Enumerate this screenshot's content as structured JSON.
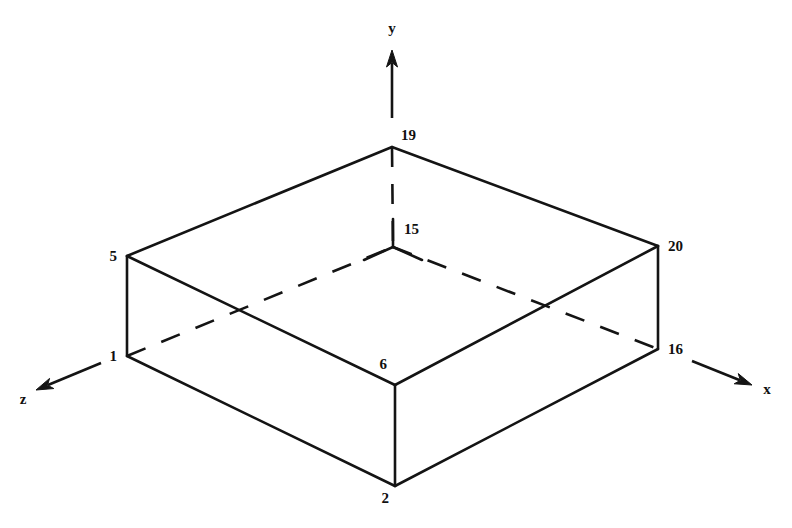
{
  "figure": {
    "background_color": "#ffffff",
    "line_color": "#141414"
  },
  "axes": [
    {
      "id": "axis-y",
      "label": "y",
      "direction": "up",
      "from": {
        "x": 392,
        "y": 118
      },
      "to": {
        "x": 392,
        "y": 50
      },
      "label_pos": {
        "x": 392,
        "y": 33
      }
    },
    {
      "id": "axis-x",
      "label": "x",
      "direction": "down-right",
      "from": {
        "x": 692,
        "y": 361
      },
      "to": {
        "x": 752,
        "y": 385
      },
      "label_pos": {
        "x": 767,
        "y": 394
      }
    },
    {
      "id": "axis-z",
      "label": "z",
      "direction": "down-left",
      "from": {
        "x": 101,
        "y": 363
      },
      "to": {
        "x": 36,
        "y": 390
      },
      "label_pos": {
        "x": 23,
        "y": 404
      }
    }
  ],
  "nodes": [
    {
      "id": "node-19",
      "label": "19",
      "x": 392,
      "y": 147,
      "label_x": 401,
      "label_y": 140,
      "face": "top-back"
    },
    {
      "id": "node-15",
      "label": "15",
      "x": 393,
      "y": 247,
      "label_x": 404,
      "label_y": 234,
      "face": "hidden-back"
    },
    {
      "id": "node-5",
      "label": "5",
      "x": 127,
      "y": 256,
      "label_x": 117,
      "label_y": 261,
      "face": "top-left"
    },
    {
      "id": "node-20",
      "label": "20",
      "x": 658,
      "y": 246,
      "label_x": 668,
      "label_y": 251,
      "face": "top-right"
    },
    {
      "id": "node-1",
      "label": "1",
      "x": 127,
      "y": 356,
      "label_x": 117,
      "label_y": 361,
      "face": "bottom-left"
    },
    {
      "id": "node-6",
      "label": "6",
      "x": 395,
      "y": 385,
      "label_x": 387,
      "label_y": 369,
      "face": "top-front"
    },
    {
      "id": "node-16",
      "label": "16",
      "x": 658,
      "y": 349,
      "label_x": 668,
      "label_y": 354,
      "face": "bottom-right"
    },
    {
      "id": "node-2",
      "label": "2",
      "x": 395,
      "y": 486,
      "label_x": 389,
      "label_y": 503,
      "face": "bottom-front"
    }
  ],
  "edges_visible": [
    {
      "id": "edge-5-19",
      "from": "node-5",
      "to": "node-19",
      "style": "solid"
    },
    {
      "id": "edge-19-20",
      "from": "node-19",
      "to": "node-20",
      "style": "solid"
    },
    {
      "id": "edge-5-6",
      "from": "node-5",
      "to": "node-6",
      "style": "solid"
    },
    {
      "id": "edge-6-20",
      "from": "node-6",
      "to": "node-20",
      "style": "solid"
    },
    {
      "id": "edge-5-1",
      "from": "node-5",
      "to": "node-1",
      "style": "solid"
    },
    {
      "id": "edge-6-2",
      "from": "node-6",
      "to": "node-2",
      "style": "solid"
    },
    {
      "id": "edge-20-16",
      "from": "node-20",
      "to": "node-16",
      "style": "solid"
    },
    {
      "id": "edge-1-2",
      "from": "node-1",
      "to": "node-2",
      "style": "solid"
    },
    {
      "id": "edge-2-16",
      "from": "node-2",
      "to": "node-16",
      "style": "solid"
    }
  ],
  "edges_hidden": [
    {
      "id": "edge-1-15",
      "from": "node-1",
      "to": "node-15",
      "style": "dashed"
    },
    {
      "id": "edge-15-16",
      "from": "node-15",
      "to": "node-16",
      "style": "dashed"
    },
    {
      "id": "edge-19-15",
      "from": "node-19",
      "to": "node-15",
      "style": "dashed"
    }
  ],
  "hidden_corner_stubs": {
    "id": "node-15-junction",
    "center": {
      "x": 393,
      "y": 247
    },
    "arms": [
      {
        "id": "stub-up",
        "dx": 0,
        "dy": -28
      },
      {
        "id": "stub-down-left",
        "dx": -29,
        "dy": 13
      },
      {
        "id": "stub-down-right",
        "dx": 29,
        "dy": 13
      }
    ]
  }
}
